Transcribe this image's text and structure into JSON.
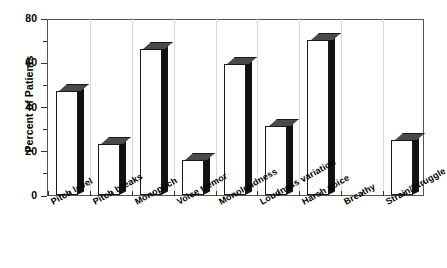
{
  "chart_data": {
    "type": "bar",
    "title": "",
    "subtitle": "",
    "xlabel": "",
    "ylabel": "Percent of Patients",
    "ylim": [
      0,
      80
    ],
    "ytick_labels": [
      "0",
      "20",
      "40",
      "60",
      "80"
    ],
    "ytick_values": [
      0,
      20,
      40,
      60,
      80
    ],
    "yminor_values": [
      10,
      30,
      50,
      70
    ],
    "grid": false,
    "legend": null,
    "legend_position": "none",
    "style_3d": true,
    "categories": [
      "Pitch level",
      "Pitch breaks",
      "Monopitch",
      "Voice tremor",
      "Monoloudness",
      "Loudness variation",
      "Harsh voice",
      "Breathy",
      "Strain/Struggle"
    ],
    "values": [
      47,
      23,
      66,
      16,
      59,
      31,
      70,
      0,
      25
    ],
    "series": [
      {
        "name": "Percent of Patients",
        "values": [
          47,
          23,
          66,
          16,
          59,
          31,
          70,
          0,
          25
        ]
      }
    ],
    "colors": {
      "bar_front": "#ffffff",
      "bar_side": "#111111",
      "bar_top": "#4a4a4a",
      "bar_outline": "#1a1a1a",
      "axis": "#333333",
      "background": "#ffffff",
      "text": "#000000"
    }
  }
}
